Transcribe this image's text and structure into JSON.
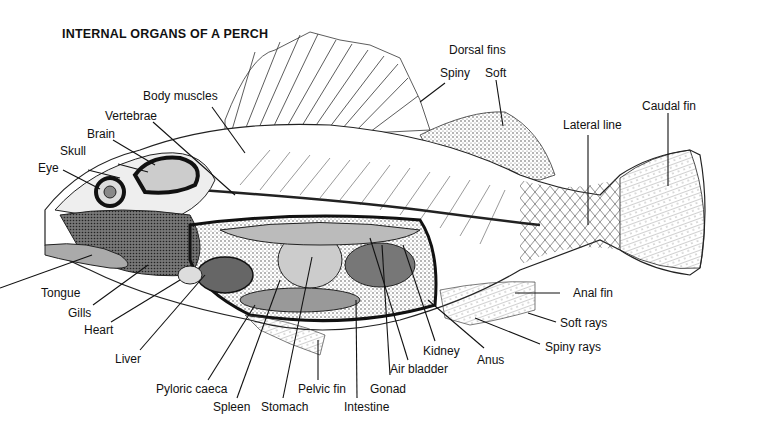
{
  "title": "INTERNAL ORGANS OF A PERCH",
  "labels": {
    "dorsal_fins": "Dorsal fins",
    "spiny": "Spiny",
    "soft": "Soft",
    "caudal_fin": "Caudal fin",
    "lateral_line": "Lateral line",
    "body_muscles": "Body muscles",
    "vertebrae": "Vertebrae",
    "brain": "Brain",
    "skull": "Skull",
    "eye": "Eye",
    "tongue": "Tongue",
    "gills": "Gills",
    "heart": "Heart",
    "liver": "Liver",
    "pyloric_caeca": "Pyloric caeca",
    "spleen": "Spleen",
    "stomach": "Stomach",
    "pelvic_fin": "Pelvic fin",
    "intestine": "Intestine",
    "gonad": "Gonad",
    "air_bladder": "Air bladder",
    "kidney": "Kidney",
    "anus": "Anus",
    "anal_fin": "Anal fin",
    "soft_rays": "Soft rays",
    "spiny_rays": "Spiny rays"
  },
  "colors": {
    "ink": "#111111",
    "background": "#ffffff",
    "shade": "#9a9a9a"
  }
}
